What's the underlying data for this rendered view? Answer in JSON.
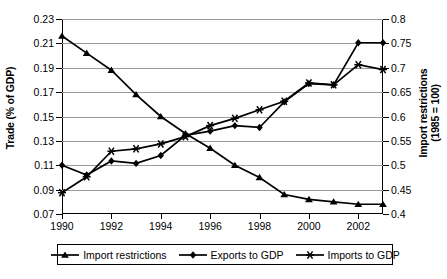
{
  "chart_data": {
    "type": "line",
    "title": "",
    "xlabel": "",
    "ylabel": "Trade (% of GDP)",
    "ylabel_right": "Import restrictions (1985 = 100)",
    "ylabel_right_line1": "Import restrictions",
    "ylabel_right_line2": "(1985 = 100)",
    "grid": true,
    "legend_position": "bottom",
    "x": [
      1990,
      1991,
      1992,
      1993,
      1994,
      1995,
      1996,
      1997,
      1998,
      1999,
      2000,
      2001,
      2002,
      2003
    ],
    "xtick_labels": [
      "1990",
      "1992",
      "1994",
      "1996",
      "1998",
      "2000",
      "2002"
    ],
    "xtick_values": [
      1990,
      1992,
      1994,
      1996,
      1998,
      2000,
      2002
    ],
    "xlim": [
      1990,
      2003
    ],
    "ylim": [
      0.07,
      0.23
    ],
    "ytick_labels": [
      "0.07",
      "0.09",
      "0.11",
      "0.13",
      "0.15",
      "0.17",
      "0.19",
      "0.21",
      "0.23"
    ],
    "ytick_values": [
      0.07,
      0.09,
      0.11,
      0.13,
      0.15,
      0.17,
      0.19,
      0.21,
      0.23
    ],
    "ylim_right": [
      0.4,
      0.8
    ],
    "ytick_labels_right": [
      "0.4",
      "0.45",
      "0.5",
      "0.55",
      "0.6",
      "0.65",
      "0.7",
      "0.75",
      "0.8"
    ],
    "ytick_values_right": [
      0.4,
      0.45,
      0.5,
      0.55,
      0.6,
      0.65,
      0.7,
      0.75,
      0.8
    ],
    "series": [
      {
        "name": "Import restrictions",
        "axis": "right",
        "marker": "triangle",
        "values": [
          0.765,
          0.73,
          0.695,
          0.645,
          0.6,
          0.565,
          0.535,
          0.5,
          0.475,
          0.44,
          0.43,
          0.425,
          0.42,
          0.42
        ]
      },
      {
        "name": "Exports to GDP",
        "axis": "left",
        "marker": "diamond",
        "values": [
          0.11,
          0.102,
          0.1135,
          0.1115,
          0.118,
          0.1345,
          0.138,
          0.1425,
          0.141,
          0.162,
          0.177,
          0.176,
          0.2105,
          0.2105
        ]
      },
      {
        "name": "Imports to GDP",
        "axis": "left",
        "marker": "asterisk",
        "values": [
          0.0875,
          0.1005,
          0.1215,
          0.1235,
          0.1275,
          0.1335,
          0.1425,
          0.1485,
          0.1555,
          0.1625,
          0.1775,
          0.176,
          0.1925,
          0.1885
        ]
      }
    ]
  },
  "legend": {
    "items": [
      {
        "label": "Import restrictions",
        "marker": "triangle"
      },
      {
        "label": "Exports to GDP",
        "marker": "diamond"
      },
      {
        "label": "Imports to GDP",
        "marker": "asterisk"
      }
    ]
  },
  "colors": {
    "series": "#000000",
    "grid": "#9a9a9a",
    "axis": "#000000",
    "background": "#ffffff"
  }
}
